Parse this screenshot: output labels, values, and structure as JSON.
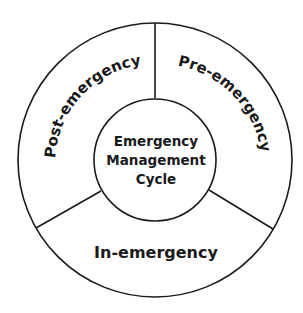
{
  "diagram": {
    "center_label_lines": [
      "Emergency",
      "Management",
      "Cycle"
    ],
    "segments": [
      {
        "label": "Pre-emergency"
      },
      {
        "label": "In-emergency"
      },
      {
        "label": "Post-emergency"
      }
    ],
    "colors": {
      "stroke": "#1a1a1a",
      "background": "#ffffff"
    }
  }
}
